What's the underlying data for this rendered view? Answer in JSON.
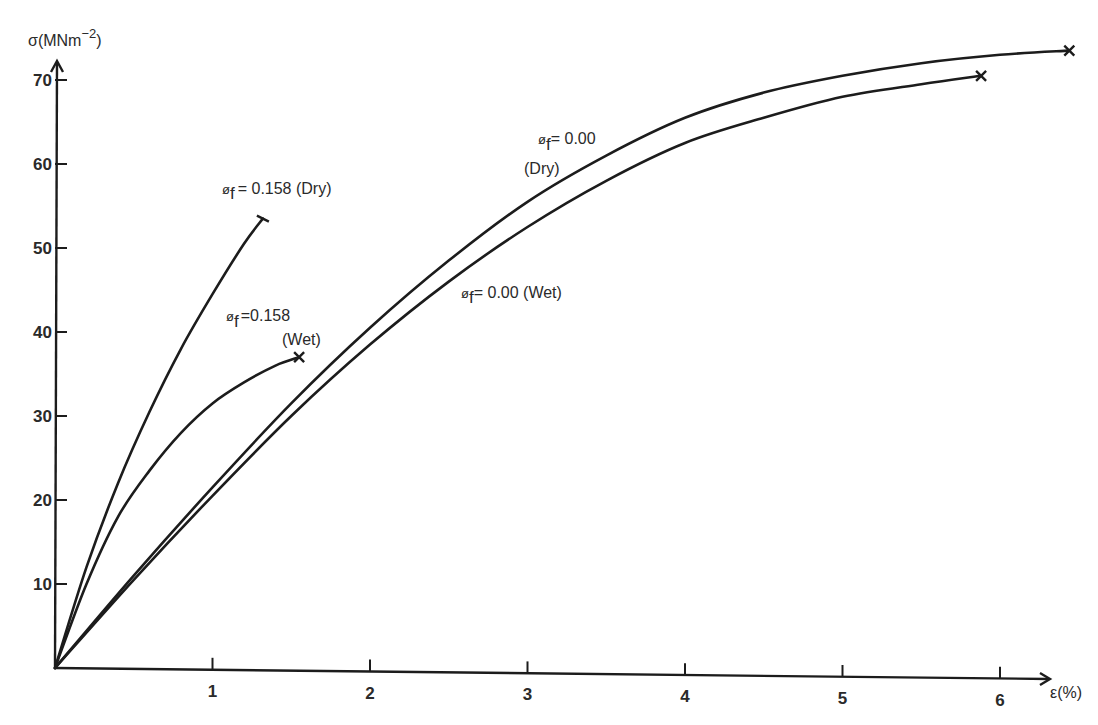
{
  "chart_data": {
    "type": "line",
    "title": "",
    "xlabel": "ε(%)",
    "ylabel": "σ(MNm⁻²)",
    "ylabel_base": "σ(MNm",
    "ylabel_sup": "−2",
    "ylabel_close": ")",
    "xlim": [
      0,
      6.6
    ],
    "ylim": [
      0,
      74
    ],
    "x_ticks": [
      1,
      2,
      3,
      4,
      5,
      6
    ],
    "y_ticks": [
      10,
      20,
      30,
      40,
      50,
      60,
      70
    ],
    "grid": false,
    "legend": "inline annotations",
    "series": [
      {
        "name": "φf = 0.158 (Dry)",
        "label_prefix": "ø",
        "label_sub": "f",
        "label_text": "= 0.158 (Dry)",
        "end_marker": "bar",
        "x": [
          0,
          0.2,
          0.4,
          0.6,
          0.8,
          1.0,
          1.2,
          1.32
        ],
        "y": [
          0,
          12,
          22,
          30.5,
          38,
          44.5,
          50.5,
          53.5
        ]
      },
      {
        "name": "φf = 0.158 (Wet)",
        "label_prefix": "ø",
        "label_sub": "f",
        "label_text": "=0.158",
        "label_text2": "(Wet)",
        "end_marker": "cross",
        "x": [
          0,
          0.2,
          0.4,
          0.6,
          0.8,
          1.0,
          1.2,
          1.4,
          1.55
        ],
        "y": [
          0,
          10,
          18,
          23.5,
          28,
          31.5,
          34,
          36,
          37
        ]
      },
      {
        "name": "φf = 0.00 (Dry)",
        "label_prefix": "ø",
        "label_sub": "f",
        "label_text": "= 0.00",
        "label_text2": "(Dry)",
        "end_marker": "cross",
        "x": [
          0,
          0.5,
          1.0,
          1.5,
          2.0,
          2.5,
          3.0,
          3.5,
          4.0,
          4.5,
          5.0,
          5.5,
          6.0,
          6.44
        ],
        "y": [
          0,
          11,
          21.5,
          31.5,
          40.5,
          48.5,
          55.5,
          61,
          65.5,
          68.5,
          70.5,
          72,
          73,
          73.5
        ]
      },
      {
        "name": "φf = 0.00 (Wet)",
        "label_prefix": "ø",
        "label_sub": "f",
        "label_text": "= 0.00 (Wet)",
        "end_marker": "cross",
        "x": [
          0,
          0.5,
          1.0,
          1.5,
          2.0,
          2.5,
          3.0,
          3.5,
          4.0,
          4.5,
          5.0,
          5.5,
          5.88
        ],
        "y": [
          0,
          10.5,
          20.5,
          30,
          38.5,
          46,
          52.5,
          58,
          62.5,
          65.5,
          68,
          69.5,
          70.5
        ]
      }
    ]
  },
  "axes": {
    "x_tick_labels": [
      "1",
      "2",
      "3",
      "4",
      "5",
      "6"
    ],
    "y_tick_labels": [
      "10",
      "20",
      "30",
      "40",
      "50",
      "60",
      "70"
    ],
    "x_title": "ε(%)"
  },
  "annotations": {
    "dry158": {
      "prefix": "ø",
      "sub": "f",
      "text": "= 0.158 (Dry)"
    },
    "wet158": {
      "prefix": "ø",
      "sub": "f",
      "text": "=0.158",
      "text2": "(Wet)"
    },
    "dry000": {
      "prefix": "ø",
      "sub": "f",
      "text": "= 0.00",
      "text2": "(Dry)"
    },
    "wet000": {
      "prefix": "ø",
      "sub": "f",
      "text": "= 0.00 (Wet)"
    }
  },
  "ylabel": {
    "base": "σ(MNm",
    "sup": "−2",
    "close": ")"
  }
}
